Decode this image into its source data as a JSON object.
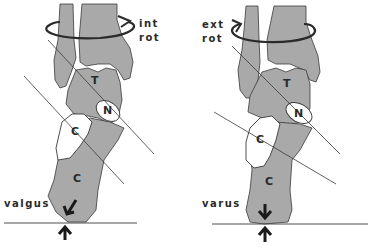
{
  "colors": {
    "bone": "#a9a9a9",
    "bone_light": "#b4b4b4",
    "outline": "#3a3a3a",
    "line": "#3a3a3a",
    "background": "#ffffff"
  },
  "left_panel": {
    "rotation_label_1": "int",
    "rotation_label_2": "rot",
    "deformity_label": "valgus",
    "bones": {
      "talus": "T",
      "navicular": "N",
      "cuboid": "C",
      "calcaneus": "C"
    }
  },
  "right_panel": {
    "rotation_label_1": "ext",
    "rotation_label_2": "rot",
    "deformity_label": "varus",
    "bones": {
      "talus": "T",
      "navicular": "N",
      "cuboid": "C",
      "calcaneus": "C"
    }
  }
}
